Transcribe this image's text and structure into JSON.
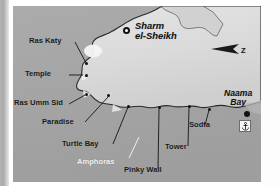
{
  "map": {
    "title": "Sharm el-Sheikh dive site map",
    "colors": {
      "sea": "#a6a6a6",
      "land": "#d9d9d9",
      "land_highlight": "#efefef",
      "coastline": "#2b2b2b",
      "label_dark": "#16181a",
      "label_light": "#f3f3f3"
    },
    "towns": [
      {
        "name": "sharm-el-sheikh",
        "line1": "Sharm",
        "line2": "el-Sheikh",
        "x": 128,
        "y": 18
      }
    ],
    "bays": [
      {
        "name": "naama-bay",
        "line1": "Naama",
        "line2": "Bay",
        "x": 219,
        "y": 88
      }
    ],
    "dive_sites": [
      {
        "name": "ras-katy",
        "label": "Ras Katy",
        "label_x": 29,
        "label_y": 35,
        "dot_x": 73,
        "dot_y": 58
      },
      {
        "name": "temple",
        "label": "Temple",
        "label_x": 25,
        "label_y": 66,
        "dot_x": 73,
        "dot_y": 71
      },
      {
        "name": "ras-umm-sid",
        "label": "Ras Umm Sid",
        "label_x": 7,
        "label_y": 96,
        "dot_x": 73,
        "dot_y": 88
      },
      {
        "name": "paradise",
        "label": "Paradise",
        "label_x": 42,
        "label_y": 119,
        "dot_x": 96,
        "dot_y": 89
      },
      {
        "name": "turtle-bay",
        "label": "Turtle Bay",
        "label_x": 60,
        "label_y": 141,
        "dot_x": 116,
        "dot_y": 99
      },
      {
        "name": "amphoras",
        "label": "Amphoras",
        "label_x": 76,
        "label_y": 160,
        "dot_x": 0,
        "dot_y": 0,
        "style": "white"
      },
      {
        "name": "pinky-wall",
        "label": "Pinky Wall",
        "label_x": 122,
        "label_y": 167,
        "dot_x": 146,
        "dot_y": 101
      },
      {
        "name": "tower",
        "label": "Tower",
        "label_x": 160,
        "label_y": 144,
        "dot_x": 176,
        "dot_y": 99
      },
      {
        "name": "sodfa",
        "label": "Sodfa",
        "label_x": 185,
        "label_y": 122,
        "dot_x": 196,
        "dot_y": 102
      }
    ],
    "compass": {
      "label": "Z",
      "x": 228,
      "y": 42
    },
    "anchor": {
      "name": "anchor-marker",
      "x": 244,
      "y": 122
    }
  }
}
